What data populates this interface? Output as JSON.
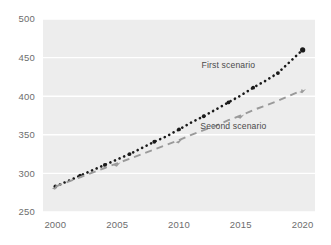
{
  "chart_data": {
    "type": "line",
    "title": "",
    "subtitle": "",
    "xlabel": "",
    "ylabel": "",
    "xlim": [
      1999,
      2021
    ],
    "ylim": [
      250,
      500
    ],
    "grid": "horizontal",
    "legend_position": "inline-annotation",
    "x_tick_labels": [
      "2000",
      "2005",
      "2010",
      "2015",
      "2020"
    ],
    "x_ticks": [
      2000,
      2005,
      2010,
      2015,
      2020
    ],
    "y_tick_labels": [
      "250",
      "300",
      "350",
      "400",
      "450",
      "500"
    ],
    "y_ticks": [
      250,
      300,
      350,
      400,
      450,
      500
    ],
    "x": [
      2000,
      2001,
      2002,
      2003,
      2004,
      2005,
      2006,
      2007,
      2008,
      2009,
      2010,
      2011,
      2012,
      2013,
      2014,
      2015,
      2016,
      2017,
      2018,
      2019,
      2020
    ],
    "series": [
      {
        "name": "First scenario",
        "color": "#1a1a1a",
        "style": "dotted",
        "marker": "circle",
        "values": [
          283,
          290,
          297,
          304,
          311,
          318,
          325,
          333,
          341,
          348,
          357,
          366,
          374,
          383,
          392,
          401,
          411,
          420,
          430,
          445,
          460
        ]
      },
      {
        "name": "Second scenario",
        "color": "#9a9a9a",
        "style": "dashed",
        "marker": "arrow",
        "values": [
          283,
          289,
          295,
          301,
          307,
          313,
          319,
          325,
          331,
          337,
          343,
          350,
          356,
          362,
          369,
          375,
          382,
          388,
          394,
          401,
          408
        ]
      }
    ],
    "annotations": [
      {
        "text": "First scenario",
        "x": 2014.0,
        "y": 437,
        "anchor": "middle"
      },
      {
        "text": "Second scenario",
        "x": 2014.4,
        "y": 358,
        "anchor": "middle"
      }
    ],
    "colors": {
      "plot_background": "#ededed",
      "gridline": "#ffffff",
      "page_background": "#ffffff",
      "tick_text": "#6d6d6d",
      "annotation_text": "#4a4a4a",
      "first_scenario": "#1a1a1a",
      "second_scenario": "#9a9a9a"
    }
  }
}
